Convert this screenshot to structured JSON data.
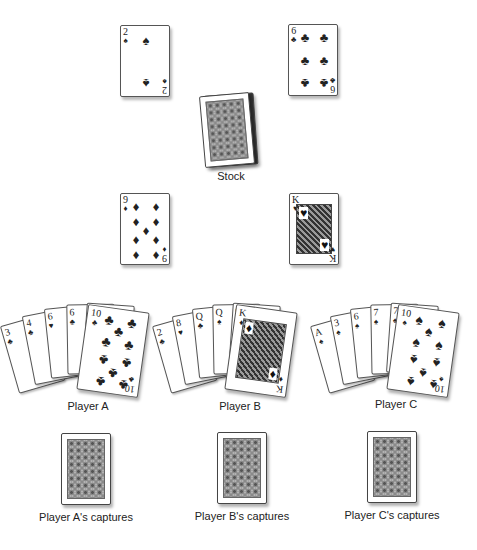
{
  "table_cards": [
    {
      "rank": "2",
      "suit": "♠",
      "suit_name": "spades"
    },
    {
      "rank": "6",
      "suit": "♣",
      "suit_name": "clubs"
    },
    {
      "rank": "9",
      "suit": "♦",
      "suit_name": "diamonds"
    },
    {
      "rank": "K",
      "suit": "♥",
      "suit_name": "hearts"
    }
  ],
  "stock": {
    "label": "Stock"
  },
  "players": [
    {
      "label": "Player A",
      "captures_label": "Player A's captures",
      "hand": [
        {
          "rank": "3",
          "suit": "♣"
        },
        {
          "rank": "4",
          "suit": "♣"
        },
        {
          "rank": "6",
          "suit": "♥"
        },
        {
          "rank": "6",
          "suit": "♣"
        },
        {
          "rank": "7",
          "suit": "♣"
        },
        {
          "rank": "10",
          "suit": "♣"
        }
      ]
    },
    {
      "label": "Player B",
      "captures_label": "Player B's captures",
      "hand": [
        {
          "rank": "2",
          "suit": "♣"
        },
        {
          "rank": "8",
          "suit": "♥"
        },
        {
          "rank": "Q",
          "suit": "♣"
        },
        {
          "rank": "Q",
          "suit": "♠"
        },
        {
          "rank": "Q",
          "suit": "♠"
        },
        {
          "rank": "K",
          "suit": "♦"
        }
      ]
    },
    {
      "label": "Player C",
      "captures_label": "Player C's captures",
      "hand": [
        {
          "rank": "A",
          "suit": "♠"
        },
        {
          "rank": "3",
          "suit": "♠"
        },
        {
          "rank": "6",
          "suit": "♠"
        },
        {
          "rank": "7",
          "suit": "♠"
        },
        {
          "rank": "7",
          "suit": "♠"
        },
        {
          "rank": "10",
          "suit": "♠"
        }
      ]
    }
  ]
}
